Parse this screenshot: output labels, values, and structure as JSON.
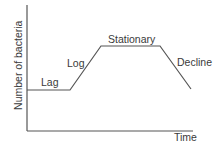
{
  "diagram": {
    "y_axis_label": "Number of bacteria",
    "x_axis_label": "Time",
    "phases": [
      {
        "name": "Lag",
        "label": "Lag"
      },
      {
        "name": "Log",
        "label": "Log"
      },
      {
        "name": "Stationary",
        "label": "Stationary"
      },
      {
        "name": "Decline",
        "label": "Decline"
      }
    ],
    "curve_points": [
      [
        27,
        90
      ],
      [
        70,
        90
      ],
      [
        101,
        46
      ],
      [
        160,
        46
      ],
      [
        191,
        89
      ]
    ],
    "colors": {
      "line": "#555555",
      "axis": "#555555",
      "text": "#3a3a3a"
    }
  }
}
